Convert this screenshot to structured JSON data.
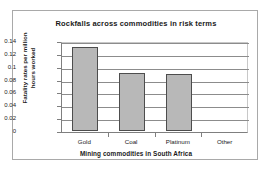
{
  "chart_data": {
    "type": "bar",
    "title": "Rockfalls across commodities in risk terms",
    "xlabel": "Mining commodities in South Africa",
    "ylabel_lines": [
      "Fatality rates per million",
      "hours worked"
    ],
    "ylabel": "Fatality rates per million hours worked",
    "categories": [
      "Gold",
      "Coal",
      "Platinum",
      "Other"
    ],
    "values": [
      0.131,
      0.09,
      0.089,
      0.0
    ],
    "ylim": [
      0,
      0.14
    ],
    "ytick_values": [
      0,
      0.02,
      0.04,
      0.06,
      0.08,
      0.1,
      0.12,
      0.14
    ],
    "ytick_labels": [
      "0",
      "0.02",
      "0.04",
      "0.06",
      "0.08",
      "0.1",
      "0.12",
      "0.14"
    ],
    "grid": true,
    "legend": false,
    "bar_color": "#b8b8b8",
    "bar_edge_color": "#4d4d4d",
    "grid_color": "#8c8c8c",
    "axis_color": "#7f7f7f",
    "frame_color": "#a9a9a9",
    "background": "#ffffff"
  }
}
